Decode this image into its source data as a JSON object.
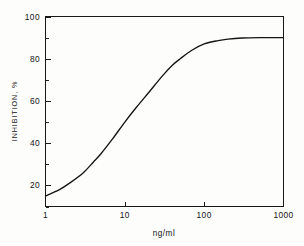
{
  "figure": {
    "background_color": "#fdfdfc",
    "ink_color": "#141414"
  },
  "axis": {
    "y_title": "INHIBITION, %",
    "x_title": "ng/ml",
    "y_ticks": [
      "20",
      "40",
      "60",
      "80",
      "100"
    ],
    "x_ticks": [
      "1",
      "10",
      "100",
      "1000"
    ]
  },
  "chart_data": {
    "type": "line",
    "title": "",
    "subtitle": "",
    "xlabel": "ng/ml",
    "ylabel": "INHIBITION, %",
    "x_scale": "log",
    "y_scale": "linear",
    "xlim": [
      1,
      1000
    ],
    "ylim": [
      10,
      100
    ],
    "grid": false,
    "legend": false,
    "legend_position": "none",
    "x_tick_labels": [
      "1",
      "10",
      "100",
      "1000"
    ],
    "x_tick_values": [
      1,
      10,
      100,
      1000
    ],
    "y_tick_labels": [
      "20",
      "40",
      "60",
      "80",
      "100"
    ],
    "y_tick_values": [
      20,
      40,
      60,
      80,
      100
    ],
    "y_minor_tick_values": [
      10,
      30,
      50,
      70,
      90
    ],
    "annotations": [],
    "series": [
      {
        "name": "inhibition",
        "x": [
          1,
          1.5,
          2,
          3,
          4,
          5,
          7,
          10,
          14,
          20,
          30,
          40,
          50,
          70,
          100,
          150,
          200,
          300,
          500,
          700,
          1000
        ],
        "values": [
          15,
          18,
          21,
          26,
          31,
          35,
          42,
          50,
          57,
          64,
          72,
          77,
          80,
          84,
          87,
          88.6,
          89.3,
          89.8,
          90,
          90,
          90
        ]
      }
    ]
  }
}
